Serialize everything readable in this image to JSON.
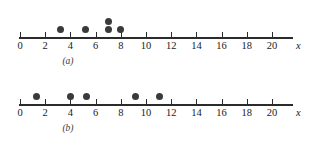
{
  "figure": {
    "axis_variable_label": "x",
    "dot_color": "#3a3a3a",
    "axis_color": "#2b2b2b",
    "background_color": "#ffffff"
  },
  "panels": [
    {
      "caption": "(a)",
      "tick_labels": [
        "0",
        "2",
        "4",
        "6",
        "8",
        "10",
        "12",
        "14",
        "16",
        "18",
        "20"
      ],
      "axis_variable_label": "x"
    },
    {
      "caption": "(b)",
      "tick_labels": [
        "0",
        "2",
        "4",
        "6",
        "8",
        "10",
        "12",
        "14",
        "16",
        "18",
        "20"
      ],
      "axis_variable_label": "x"
    }
  ],
  "chart_data": [
    {
      "type": "scatter",
      "title": "(a)",
      "xlabel": "x",
      "ylabel": "",
      "xlim": [
        0,
        21.5
      ],
      "grid": false,
      "legend": false,
      "xticks": [
        0,
        2,
        4,
        6,
        8,
        10,
        12,
        14,
        16,
        18,
        20
      ],
      "xtick_labels": [
        "0",
        "2",
        "4",
        "6",
        "8",
        "10",
        "12",
        "14",
        "16",
        "18",
        "20"
      ],
      "points": [
        {
          "x": 3.2,
          "stack": 1
        },
        {
          "x": 5.2,
          "stack": 1
        },
        {
          "x": 7.0,
          "stack": 1
        },
        {
          "x": 7.0,
          "stack": 2
        },
        {
          "x": 8.0,
          "stack": 1
        }
      ],
      "values": [
        3.2,
        5.2,
        7.0,
        7.0,
        8.0
      ]
    },
    {
      "type": "scatter",
      "title": "(b)",
      "xlabel": "x",
      "ylabel": "",
      "xlim": [
        0,
        21.5
      ],
      "grid": false,
      "legend": false,
      "xticks": [
        0,
        2,
        4,
        6,
        8,
        10,
        12,
        14,
        16,
        18,
        20
      ],
      "xtick_labels": [
        "0",
        "2",
        "4",
        "6",
        "8",
        "10",
        "12",
        "14",
        "16",
        "18",
        "20"
      ],
      "points": [
        {
          "x": 1.3,
          "stack": 1
        },
        {
          "x": 4.0,
          "stack": 1
        },
        {
          "x": 5.3,
          "stack": 1
        },
        {
          "x": 9.2,
          "stack": 1
        },
        {
          "x": 11.1,
          "stack": 1
        }
      ],
      "values": [
        1.3,
        4.0,
        5.3,
        9.2,
        11.1
      ]
    }
  ]
}
